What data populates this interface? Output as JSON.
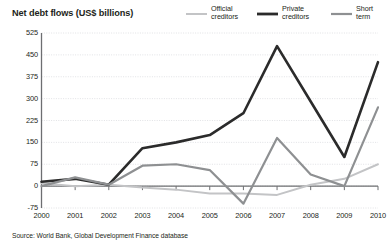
{
  "chart_data": {
    "type": "line",
    "title": "Net debt flows (US$ billions)",
    "xlabel": "",
    "ylabel": "",
    "unit": "US$ billions",
    "grid": true,
    "legend_position": "top-right",
    "x": [
      2000,
      2001,
      2002,
      2003,
      2004,
      2005,
      2006,
      2007,
      2008,
      2009,
      2010
    ],
    "categories": [
      "2000",
      "2001",
      "2002",
      "2003",
      "2004",
      "2005",
      "2006",
      "2007",
      "2008",
      "2009",
      "2010"
    ],
    "ylim": [
      -75,
      525
    ],
    "yticks": [
      525,
      450,
      375,
      300,
      225,
      150,
      75,
      0,
      -75
    ],
    "ytick_labels": [
      "525",
      "450",
      "375",
      "300",
      "225",
      "150",
      "75",
      "0",
      "-75"
    ],
    "series": [
      {
        "name": "Official creditors",
        "label": "Official\ncreditors",
        "color": "#c3c4c6",
        "width": 2.0,
        "values": [
          10,
          0,
          5,
          -5,
          -12,
          -25,
          -25,
          -30,
          5,
          25,
          75
        ]
      },
      {
        "name": "Private creditors",
        "label": "Private\ncreditors",
        "color": "#2b2b2b",
        "width": 2.6,
        "values": [
          15,
          25,
          5,
          130,
          150,
          175,
          250,
          480,
          290,
          100,
          425
        ]
      },
      {
        "name": "Short term",
        "label": "Short\nterm",
        "color": "#8e9092",
        "width": 2.2,
        "values": [
          0,
          30,
          5,
          70,
          75,
          55,
          -60,
          165,
          40,
          0,
          270
        ]
      }
    ]
  },
  "source": {
    "text": "Source: World Bank, Global Development Finance database"
  },
  "colors": {
    "official": "#c3c4c6",
    "private": "#2b2b2b",
    "short_term": "#8e9092",
    "gridline": "#d9dade",
    "axis": "#6d6e71",
    "text": "#231f20",
    "background": "#ffffff"
  }
}
